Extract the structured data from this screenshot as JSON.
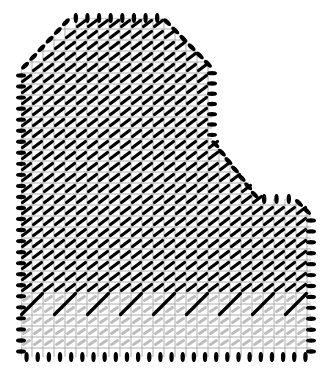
{
  "diagram": {
    "type": "stitch-pattern-grid",
    "background": "#ffffff",
    "grid_color": "#9a9a9a",
    "stitch_color": "#000000",
    "ghost_stitch_color": "#bdbdbd",
    "cell_size": 11,
    "outline": [
      [
        70,
        18
      ],
      [
        163,
        18
      ],
      [
        212,
        68
      ],
      [
        212,
        140
      ],
      [
        258,
        199
      ],
      [
        295,
        199
      ],
      [
        311,
        215
      ],
      [
        311,
        357
      ],
      [
        21,
        357
      ],
      [
        21,
        70
      ]
    ],
    "sparse_region_top": 296,
    "sparse_region_rows": 5,
    "edge_stitches": "vertical oval stitches along top and bottom edges, horizontal oval stitches along left/right edges, diagonal stitches along slanted edges",
    "fill_stitch": "diagonal (45°) tent stitch in black, filling interior",
    "bottom_band": "alternating rows with occasional black diagonal stitches and light-gray ghost stitches"
  }
}
